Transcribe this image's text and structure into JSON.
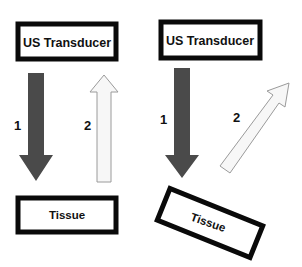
{
  "diagram": {
    "left_panel": {
      "transducer_label": "US Transducer",
      "tissue_label": "Tissue",
      "arrow_1_label": "1",
      "arrow_2_label": "2",
      "tissue_orientation": "perpendicular"
    },
    "right_panel": {
      "transducer_label": "US Transducer",
      "tissue_label": "Tissue",
      "arrow_1_label": "1",
      "arrow_2_label": "2",
      "tissue_orientation": "tilted"
    },
    "colors": {
      "box_border": "#0a0a0a",
      "incident_arrow": "#4a4a4a",
      "reflected_arrow_fill": "#f7f7f7",
      "reflected_arrow_stroke": "#9a9a9a"
    }
  }
}
